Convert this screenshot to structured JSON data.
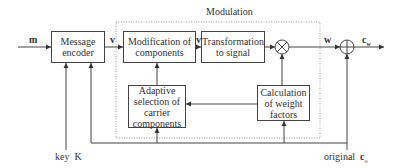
{
  "diagram": {
    "group_label": "Modulation",
    "blocks": {
      "encoder": "Message encoder",
      "modification": "Modification of components",
      "transformation": "Transformation to signal",
      "adaptive": "Adaptive selection of carrier components",
      "calculation": "Calculation of weight factors"
    },
    "operators": {
      "multiplier": "⊗",
      "adder": "⊕"
    },
    "signals": {
      "input_m": "m",
      "v1": "v",
      "v2": "v",
      "w": "w",
      "output_cw": "c",
      "output_cw_sub": "w",
      "key_label": "key",
      "key_symbol": "K",
      "original_label": "original",
      "original_symbol": "c",
      "original_sub": "o"
    },
    "colors": {
      "line": "#444444",
      "dotted_border": "#888888",
      "text": "#333333"
    }
  }
}
